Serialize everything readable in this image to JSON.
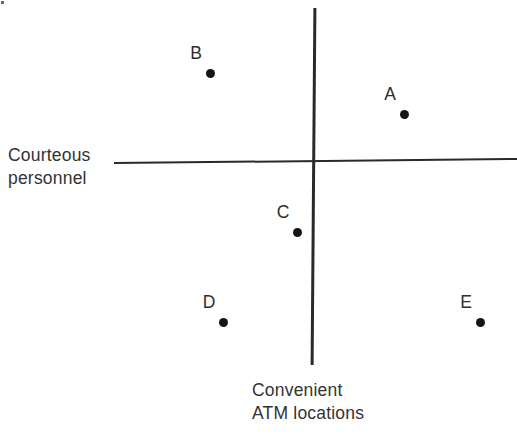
{
  "figure": {
    "background": "#ffffff",
    "line_color": "#2a2a2a",
    "text_color": "#333333",
    "dot_color": "#151515"
  },
  "axis_labels": {
    "horizontal_axis": {
      "line1": "Courteous",
      "line2": "personnel"
    },
    "vertical_axis": {
      "line1": "Convenient",
      "line2": "ATM locations"
    }
  },
  "chart_data": {
    "type": "scatter",
    "title": "",
    "xlabel": "Courteous personnel",
    "ylabel": "Convenient ATM locations",
    "axes": {
      "x_label_position": "left end of horizontal axis",
      "y_label_position": "below bottom end of vertical axis",
      "ticks": "none",
      "tick_labels": "none",
      "grid": false,
      "legend": "none",
      "x_range_units": [
        -1,
        1
      ],
      "y_range_units": [
        -1,
        1
      ]
    },
    "points": [
      {
        "label": "A",
        "x": 0.46,
        "y": 0.3,
        "px": [
          404,
          114
        ]
      },
      {
        "label": "B",
        "x": -0.51,
        "y": 0.57,
        "px": [
          210,
          73
        ]
      },
      {
        "label": "C",
        "x": -0.08,
        "y": -0.35,
        "px": [
          297,
          232
        ]
      },
      {
        "label": "D",
        "x": -0.45,
        "y": -0.79,
        "px": [
          223,
          322
        ]
      },
      {
        "label": "E",
        "x": 0.83,
        "y": -0.79,
        "px": [
          480,
          322
        ]
      }
    ]
  }
}
